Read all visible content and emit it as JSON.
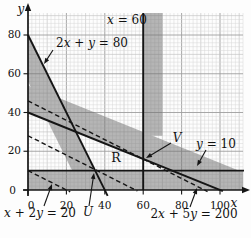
{
  "figure": {
    "background": "#fdfdfd",
    "band_color": "#6f6f6f",
    "band_opacity": 0.5,
    "grid_minor_color": "#d7d7d7",
    "grid_mid_color": "#c3c3c3",
    "grid_major_color": "#9e9e9e",
    "line_color": "#151515"
  },
  "chart_data": {
    "type": "line",
    "x_axis": {
      "label": "x",
      "ticks": [
        0,
        20,
        40,
        60,
        80,
        100
      ],
      "range": [
        0,
        112
      ]
    },
    "y_axis": {
      "label": "y",
      "ticks": [
        0,
        20,
        40,
        60,
        80
      ],
      "range": [
        0,
        90
      ]
    },
    "grid": {
      "minor_step": 2,
      "mid_step": 10,
      "major_step": 20,
      "grid_on": true
    },
    "boundary_lines": [
      {
        "id": "x-60",
        "equation": "x = 60",
        "style": "solid",
        "points": [
          [
            60,
            0
          ],
          [
            60,
            91.3
          ]
        ]
      },
      {
        "id": "2x-y-80",
        "equation": "2x + y = 80",
        "style": "solid",
        "points": [
          [
            0,
            80
          ],
          [
            41.5,
            -3
          ]
        ]
      },
      {
        "id": "y-10",
        "equation": "y = 10",
        "style": "solid",
        "points": [
          [
            0,
            10
          ],
          [
            112.5,
            10
          ]
        ]
      },
      {
        "id": "2x-5y-200",
        "equation": "2x + 5y = 200",
        "style": "solid",
        "points": [
          [
            0,
            40
          ],
          [
            101.5,
            -0.6
          ]
        ]
      },
      {
        "id": "x-2y-20",
        "equation": "x + 2y = 20",
        "style": "dashed",
        "points": [
          [
            0,
            10
          ],
          [
            22,
            -1
          ]
        ]
      },
      {
        "id": "iso-line-1",
        "equation": "",
        "style": "dashed",
        "points": [
          [
            0,
            28
          ],
          [
            57,
            -0.5
          ]
        ]
      },
      {
        "id": "iso-line-2",
        "equation": "",
        "style": "dashed",
        "points": [
          [
            0,
            46
          ],
          [
            93.5,
            -0.8
          ]
        ]
      }
    ],
    "shaded_regions": [
      {
        "id": "below-y-10",
        "polygon": [
          [
            0,
            0
          ],
          [
            112,
            0
          ],
          [
            112,
            10
          ],
          [
            0,
            10
          ]
        ]
      },
      {
        "id": "right-of-x-60",
        "polygon": [
          [
            60,
            28
          ],
          [
            70,
            28
          ],
          [
            70,
            91.3
          ],
          [
            60,
            91.3
          ]
        ]
      },
      {
        "id": "left-of-2x-y-80",
        "polygon": [
          [
            0,
            80
          ],
          [
            40,
            0
          ],
          [
            28,
            0
          ],
          [
            0,
            56
          ]
        ]
      },
      {
        "id": "above-2x-5y-200",
        "polygon": [
          [
            0,
            54
          ],
          [
            112,
            9.2
          ],
          [
            112,
            0
          ],
          [
            100,
            0
          ],
          [
            0,
            40
          ]
        ]
      }
    ],
    "labels": [
      {
        "id": "eq-x-60",
        "text": "x = 60",
        "px": 127,
        "py": 20,
        "size": 12,
        "mode": "mixed"
      },
      {
        "id": "eq-2x-y-80",
        "text": "2x + y = 80",
        "px": 92,
        "py": 43,
        "size": 12,
        "mode": "mixed"
      },
      {
        "id": "eq-y-10",
        "text": "y = 10",
        "px": 216,
        "py": 144,
        "size": 12,
        "mode": "mixed"
      },
      {
        "id": "eq-x-2y-20",
        "text": "x + 2y = 20",
        "px": 40,
        "py": 213,
        "size": 12,
        "mode": "mixed"
      },
      {
        "id": "eq-2x-5y-200",
        "text": "2x + 5y = 200",
        "px": 194,
        "py": 214,
        "size": 12,
        "mode": "mixed"
      },
      {
        "id": "point-U",
        "text": "U",
        "px": 88,
        "py": 212,
        "size": 12,
        "mode": "italic"
      },
      {
        "id": "point-V",
        "text": "V",
        "px": 177,
        "py": 138,
        "size": 12,
        "mode": "italic"
      },
      {
        "id": "region-R",
        "text": "R",
        "px": 116,
        "py": 158,
        "size": 12.5,
        "mode": "plain"
      },
      {
        "id": "axis-x-label",
        "text": "x",
        "px": 234,
        "py": 203,
        "size": 12,
        "mode": "italic"
      },
      {
        "id": "axis-y-label",
        "text": "y",
        "px": 21,
        "py": 9,
        "size": 12,
        "mode": "italic"
      }
    ],
    "annotation_arrows": [
      {
        "id": "arrow-2x-y-80",
        "from": [
          53,
          50
        ],
        "to": [
          44,
          64
        ]
      },
      {
        "id": "arrow-y-10",
        "from": [
          206,
          150
        ],
        "to": [
          197,
          166
        ]
      },
      {
        "id": "arrow-x-2y-20",
        "from": [
          44,
          206
        ],
        "to": [
          52,
          184
        ]
      },
      {
        "id": "arrow-2x-5y-200",
        "from": [
          190,
          207
        ],
        "to": [
          197,
          188
        ]
      },
      {
        "id": "arrow-U",
        "from": [
          89,
          206
        ],
        "to": [
          94,
          173
        ]
      },
      {
        "id": "arrow-V",
        "from": [
          171,
          143
        ],
        "to": [
          146,
          158
        ]
      }
    ],
    "points": [
      {
        "name": "U",
        "at": [
          35,
          10
        ]
      },
      {
        "name": "V",
        "at": [
          60,
          16
        ]
      }
    ]
  }
}
